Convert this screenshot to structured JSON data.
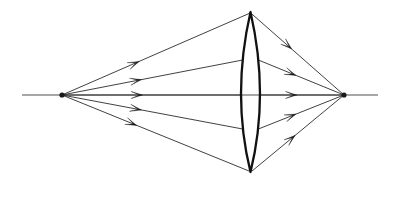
{
  "figure": {
    "kind": "optical-ray-diagram",
    "background_color": "#ffffff",
    "line_color": "#2b2b2b",
    "lens_color": "#111111",
    "arrow_color": "#1a1a1a",
    "canvas": {
      "width": 399,
      "height": 197
    }
  },
  "optical_axis": {
    "label": "optical-axis",
    "x_start": 22,
    "x_end": 378,
    "y": 95
  },
  "lens": {
    "label": "biconvex-converging-lens",
    "center_x": 250.5,
    "center_y": 95,
    "top_apex_y": 12,
    "bottom_apex_y": 172,
    "half_thickness": 9.5,
    "left_edge_x": 241,
    "right_edge_x": 260
  },
  "object_point": {
    "label": "source-point",
    "x": 62,
    "y": 95
  },
  "image_point": {
    "label": "focus-point",
    "x": 344,
    "y": 95
  },
  "rays": [
    {
      "id": "ray-1-upper-outer",
      "lens_hit_y": 13,
      "incoming_arrow_t": 0.41,
      "outgoing_arrow_t": 0.44
    },
    {
      "id": "ray-2-upper-inner",
      "lens_hit_y": 60,
      "incoming_arrow_t": 0.44,
      "outgoing_arrow_t": 0.44
    },
    {
      "id": "ray-3-axial",
      "lens_hit_y": 95,
      "incoming_arrow_t": 0.45,
      "outgoing_arrow_t": 0.44
    },
    {
      "id": "ray-4-lower-inner",
      "lens_hit_y": 129,
      "incoming_arrow_t": 0.44,
      "outgoing_arrow_t": 0.44
    },
    {
      "id": "ray-5-lower-outer",
      "lens_hit_y": 171,
      "incoming_arrow_t": 0.4,
      "outgoing_arrow_t": 0.47
    }
  ],
  "arrow_style": {
    "length": 11.5,
    "half_width": 3.6,
    "tail_notch": 0.3
  }
}
